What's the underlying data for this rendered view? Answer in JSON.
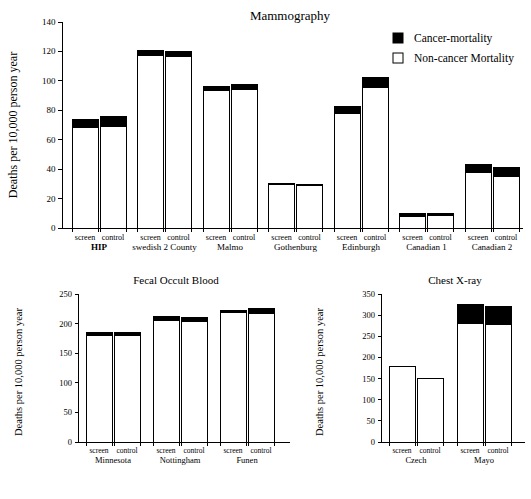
{
  "figure": {
    "ylabel": "Deaths per 10,000 person year",
    "arm_screen": "screen",
    "arm_control": "control"
  },
  "legend": {
    "position": "top-right",
    "items": [
      {
        "label": "Cancer-mortality",
        "swatch": "filled-square-icon",
        "color": "#000000"
      },
      {
        "label": "Non-cancer Mortality",
        "swatch": "open-square-icon",
        "color": "#ffffff"
      }
    ]
  },
  "chart_data": [
    {
      "id": "mammography",
      "type": "bar",
      "title": "Mammography",
      "xlabel": "",
      "ylabel": "Deaths per 10,000 person year",
      "ylim": [
        0,
        140
      ],
      "yticks": [
        0,
        20,
        40,
        60,
        80,
        100,
        120,
        140
      ],
      "grid": false,
      "stacked": true,
      "legend_position": "top-right",
      "categories": [
        "HIP",
        "swedish 2 County",
        "Malmo",
        "Gothenburg",
        "Edinburgh",
        "Canadian 1",
        "Canadian 2"
      ],
      "bold_categories": [
        "HIP"
      ],
      "arms": [
        "screen",
        "control"
      ],
      "series": [
        {
          "name": "Non-cancer Mortality",
          "color": "#ffffff",
          "values": [
            68.0,
            69.0,
            117.0,
            116.5,
            93.5,
            94.0,
            30.0,
            29.0,
            77.5,
            95.5,
            7.5,
            8.5,
            38.0,
            35.0
          ]
        },
        {
          "name": "Cancer-mortality",
          "color": "#000000",
          "values": [
            5.5,
            7.0,
            3.5,
            3.5,
            2.5,
            3.5,
            0.5,
            0.5,
            5.0,
            6.5,
            2.5,
            1.5,
            5.0,
            6.0
          ]
        }
      ],
      "totals": [
        73.5,
        76.0,
        120.5,
        120.0,
        96.0,
        97.5,
        30.5,
        29.5,
        82.5,
        102.0,
        10.0,
        10.0,
        43.0,
        41.0
      ]
    },
    {
      "id": "fecal_occult_blood",
      "type": "bar",
      "title": "Fecal Occult Blood",
      "xlabel": "",
      "ylabel": "Deaths per 10,000 person year",
      "ylim": [
        0,
        250
      ],
      "yticks": [
        0,
        50,
        100,
        150,
        200,
        250
      ],
      "grid": false,
      "stacked": true,
      "categories": [
        "Minnesota",
        "Nottingham",
        "Funen"
      ],
      "bold_categories": [],
      "arms": [
        "screen",
        "control"
      ],
      "series": [
        {
          "name": "Non-cancer Mortality",
          "color": "#ffffff",
          "values": [
            180.0,
            180.0,
            206.0,
            204.0,
            218.0,
            217.0
          ]
        },
        {
          "name": "Cancer-mortality",
          "color": "#000000",
          "values": [
            5.0,
            5.0,
            6.0,
            6.0,
            4.0,
            8.0
          ]
        }
      ],
      "totals": [
        185.0,
        185.0,
        212.0,
        210.0,
        222.0,
        225.0
      ]
    },
    {
      "id": "chest_xray",
      "type": "bar",
      "title": "Chest X-ray",
      "xlabel": "",
      "ylabel": "Deaths per 10,000 person year",
      "ylim": [
        0,
        350
      ],
      "yticks": [
        0,
        50,
        100,
        150,
        200,
        250,
        300,
        350
      ],
      "grid": false,
      "stacked": true,
      "categories": [
        "Czech",
        "Mayo"
      ],
      "bold_categories": [],
      "arms": [
        "screen",
        "control"
      ],
      "series": [
        {
          "name": "Non-cancer Mortality",
          "color": "#ffffff",
          "values": [
            178.0,
            151.0,
            280.0,
            278.0
          ]
        },
        {
          "name": "Cancer-mortality",
          "color": "#000000",
          "values": [
            0.0,
            0.0,
            45.0,
            42.0
          ]
        }
      ],
      "totals": [
        178.0,
        151.0,
        325.0,
        320.0
      ]
    }
  ]
}
